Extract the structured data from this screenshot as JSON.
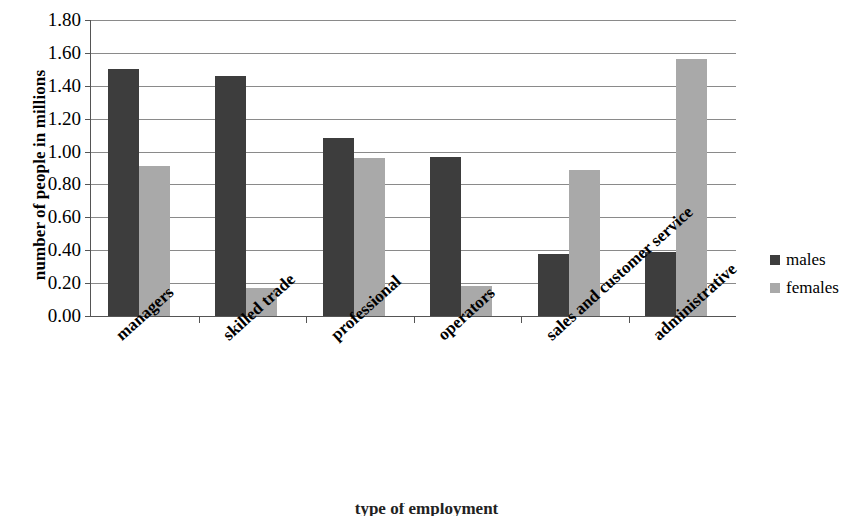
{
  "chart_data": {
    "type": "bar",
    "title": "",
    "xlabel": "type of employment",
    "ylabel": "number of people in millions",
    "categories": [
      "managers",
      "skilled trade",
      "professional",
      "operators",
      "sales and customer service",
      "administrative"
    ],
    "series": [
      {
        "name": "males",
        "color": "#3d3d3d",
        "values": [
          1.5,
          1.46,
          1.08,
          0.97,
          0.38,
          0.39
        ]
      },
      {
        "name": "females",
        "color": "#a9a9a9",
        "values": [
          0.91,
          0.17,
          0.96,
          0.18,
          0.89,
          1.56
        ]
      }
    ],
    "ylim": [
      0.0,
      1.8
    ],
    "ytick_step": 0.2,
    "ytick_labels": [
      "0.00",
      "0.20",
      "0.40",
      "0.60",
      "0.80",
      "1.00",
      "1.20",
      "1.40",
      "1.60",
      "1.80"
    ],
    "grid": true,
    "legend_position": "right"
  },
  "legend": {
    "entries": [
      {
        "label": "males"
      },
      {
        "label": "females"
      }
    ]
  },
  "colors": {
    "males": "#3d3d3d",
    "females": "#a9a9a9",
    "gridline": "#8a8a8a",
    "axis": "#555555",
    "background": "#ffffff"
  }
}
